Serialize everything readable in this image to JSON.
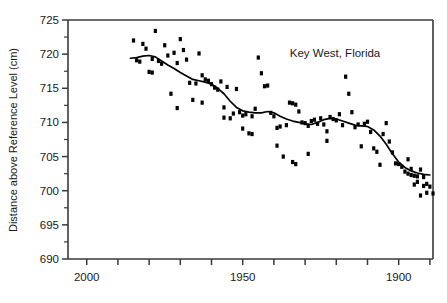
{
  "chart_data": {
    "type": "scatter",
    "title": "",
    "annotation": "Key West, Florida",
    "xlabel": "",
    "ylabel": "Distance above Reference Level (cm)",
    "xlim": [
      2006,
      1889
    ],
    "ylim": [
      690,
      725
    ],
    "x_reversed": true,
    "grid": false,
    "legend": "none",
    "y_ticks": [
      690,
      695,
      700,
      705,
      710,
      715,
      720,
      725
    ],
    "y_tick_labels": [
      "690",
      "695",
      "700",
      "705",
      "710",
      "715",
      "720",
      "725"
    ],
    "y_minor_step": 2.5,
    "x_ticks": [
      2000,
      1990,
      1980,
      1970,
      1960,
      1950,
      1940,
      1930,
      1920,
      1910,
      1900,
      1890
    ],
    "x_tick_labels_shown": [
      {
        "value": 2000,
        "label": "2000"
      },
      {
        "value": 1950,
        "label": "1950"
      },
      {
        "value": 1900,
        "label": "1900"
      }
    ],
    "marker_style": "filled-rectangle",
    "series": [
      {
        "name": "Annual mean sea level",
        "points": [
          [
            1985,
            722.0
          ],
          [
            1984,
            719.1
          ],
          [
            1983,
            718.9
          ],
          [
            1982,
            721.5
          ],
          [
            1981,
            720.8
          ],
          [
            1980,
            717.4
          ],
          [
            1979,
            719.3
          ],
          [
            1978,
            723.4
          ],
          [
            1977,
            719.0
          ],
          [
            1976,
            718.6
          ],
          [
            1975,
            721.3
          ],
          [
            1974,
            719.8
          ],
          [
            1973,
            714.2
          ],
          [
            1972,
            720.2
          ],
          [
            1971,
            718.7
          ],
          [
            1970,
            722.2
          ],
          [
            1969,
            720.6
          ],
          [
            1968,
            719.2
          ],
          [
            1967,
            715.8
          ],
          [
            1966,
            713.3
          ],
          [
            1965,
            715.7
          ],
          [
            1964,
            720.1
          ],
          [
            1963,
            716.9
          ],
          [
            1962,
            716.3
          ],
          [
            1961,
            716.1
          ],
          [
            1960,
            715.6
          ],
          [
            1959,
            715.1
          ],
          [
            1958,
            714.8
          ],
          [
            1957,
            716.0
          ],
          [
            1956,
            712.2
          ],
          [
            1955,
            715.2
          ],
          [
            1954,
            710.6
          ],
          [
            1953,
            711.3
          ],
          [
            1952,
            714.9
          ],
          [
            1951,
            711.5
          ],
          [
            1950,
            711.0
          ],
          [
            1949,
            711.2
          ],
          [
            1948,
            708.4
          ],
          [
            1947,
            710.9
          ],
          [
            1946,
            712.0
          ],
          [
            1945,
            719.5
          ],
          [
            1944,
            717.2
          ],
          [
            1943,
            715.3
          ],
          [
            1942,
            715.4
          ],
          [
            1941,
            711.4
          ],
          [
            1940,
            710.9
          ],
          [
            1939,
            709.2
          ],
          [
            1938,
            709.4
          ],
          [
            1937,
            705.0
          ],
          [
            1936,
            709.6
          ],
          [
            1935,
            712.9
          ],
          [
            1934,
            712.8
          ],
          [
            1933,
            712.6
          ],
          [
            1932,
            711.6
          ],
          [
            1931,
            710.0
          ],
          [
            1930,
            709.9
          ],
          [
            1929,
            709.5
          ],
          [
            1928,
            710.2
          ],
          [
            1927,
            710.4
          ],
          [
            1926,
            709.8
          ],
          [
            1925,
            710.6
          ],
          [
            1924,
            709.7
          ],
          [
            1923,
            708.7
          ],
          [
            1922,
            710.8
          ],
          [
            1921,
            710.5
          ],
          [
            1920,
            710.3
          ],
          [
            1919,
            711.2
          ],
          [
            1918,
            709.6
          ],
          [
            1917,
            716.7
          ],
          [
            1916,
            714.2
          ],
          [
            1915,
            711.5
          ],
          [
            1914,
            709.3
          ],
          [
            1913,
            709.7
          ],
          [
            1912,
            706.5
          ],
          [
            1911,
            709.8
          ],
          [
            1910,
            710.1
          ],
          [
            1909,
            708.6
          ],
          [
            1908,
            706.2
          ],
          [
            1907,
            705.7
          ],
          [
            1906,
            703.8
          ],
          [
            1905,
            708.3
          ],
          [
            1904,
            709.9
          ],
          [
            1903,
            707.2
          ],
          [
            1902,
            705.6
          ],
          [
            1901,
            704.0
          ],
          [
            1900,
            703.9
          ],
          [
            1899,
            703.5
          ],
          [
            1898,
            702.8
          ],
          [
            1897,
            702.5
          ],
          [
            1896,
            702.3
          ],
          [
            1895,
            700.9
          ],
          [
            1894,
            701.3
          ],
          [
            1893,
            699.3
          ],
          [
            1892,
            700.7
          ],
          [
            1891,
            701.0
          ],
          [
            1890,
            700.6
          ],
          [
            1889,
            699.6
          ],
          [
            1897,
            704.6
          ],
          [
            1896,
            703.2
          ],
          [
            1895,
            702.2
          ],
          [
            1894,
            702.1
          ],
          [
            1893,
            703.1
          ],
          [
            1892,
            702.0
          ],
          [
            1891,
            699.7
          ],
          [
            1923,
            707.3
          ],
          [
            1933,
            703.9
          ],
          [
            1934,
            704.2
          ],
          [
            1950,
            709.1
          ],
          [
            1963,
            712.9
          ],
          [
            1971,
            712.1
          ],
          [
            1979,
            717.3
          ],
          [
            1956,
            710.7
          ],
          [
            1947,
            708.3
          ],
          [
            1939,
            706.6
          ],
          [
            1929,
            705.4
          ]
        ]
      }
    ],
    "trend_line": {
      "name": "Smoothed trend",
      "points": [
        [
          1986,
          719.4
        ],
        [
          1984,
          719.5
        ],
        [
          1982,
          719.7
        ],
        [
          1980,
          719.8
        ],
        [
          1978,
          719.6
        ],
        [
          1976,
          719.0
        ],
        [
          1974,
          718.4
        ],
        [
          1972,
          717.9
        ],
        [
          1970,
          717.3
        ],
        [
          1968,
          716.8
        ],
        [
          1966,
          716.3
        ],
        [
          1964,
          716.1
        ],
        [
          1962,
          715.9
        ],
        [
          1960,
          715.6
        ],
        [
          1958,
          715.0
        ],
        [
          1956,
          714.2
        ],
        [
          1954,
          713.1
        ],
        [
          1952,
          712.2
        ],
        [
          1950,
          711.7
        ],
        [
          1948,
          711.5
        ],
        [
          1946,
          711.4
        ],
        [
          1944,
          711.4
        ],
        [
          1942,
          711.6
        ],
        [
          1940,
          711.4
        ],
        [
          1938,
          710.9
        ],
        [
          1936,
          710.5
        ],
        [
          1934,
          710.2
        ],
        [
          1932,
          710.0
        ],
        [
          1930,
          709.8
        ],
        [
          1928,
          709.7
        ],
        [
          1926,
          710.0
        ],
        [
          1924,
          710.4
        ],
        [
          1922,
          710.6
        ],
        [
          1920,
          710.5
        ],
        [
          1918,
          710.2
        ],
        [
          1916,
          709.9
        ],
        [
          1914,
          709.6
        ],
        [
          1912,
          709.5
        ],
        [
          1910,
          709.4
        ],
        [
          1908,
          708.9
        ],
        [
          1906,
          708.0
        ],
        [
          1904,
          706.8
        ],
        [
          1902,
          705.4
        ],
        [
          1900,
          704.2
        ],
        [
          1898,
          703.4
        ],
        [
          1896,
          702.9
        ],
        [
          1894,
          702.6
        ],
        [
          1892,
          702.4
        ],
        [
          1890,
          702.3
        ]
      ]
    }
  },
  "axes": {
    "y_axis_title": "Distance above Reference Level (cm)"
  }
}
